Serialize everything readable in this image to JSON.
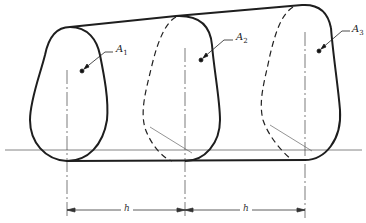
{
  "diagram": {
    "type": "prismoidal-solid-cross-sections",
    "colors": {
      "outline": "#222222",
      "thin": "#555555",
      "background": "#ffffff"
    },
    "sections": [
      {
        "id": "A1",
        "label": "A",
        "subscript": "1",
        "label_pos": [
          116,
          48
        ],
        "centroid": [
          82,
          71
        ]
      },
      {
        "id": "A2",
        "label": "A",
        "subscript": "2",
        "label_pos": [
          237,
          35
        ],
        "centroid": [
          201,
          60
        ]
      },
      {
        "id": "A3",
        "label": "A",
        "subscript": "3",
        "label_pos": [
          353,
          28
        ],
        "centroid": [
          319,
          51
        ]
      }
    ],
    "dimensions": [
      {
        "label": "h",
        "from_x": 67,
        "to_x": 185,
        "y": 210
      },
      {
        "label": "h",
        "from_x": 185,
        "to_x": 305,
        "y": 210
      }
    ]
  }
}
